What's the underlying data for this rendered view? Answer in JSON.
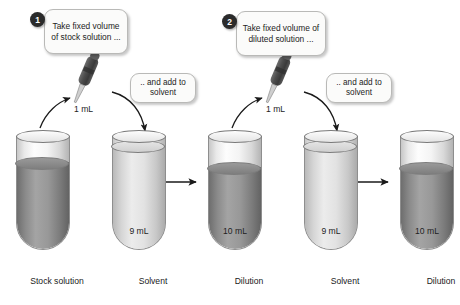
{
  "diagram": {
    "steps": [
      {
        "number": "1",
        "badge_name": "step-1-badge",
        "callout": "Take fixed volume of stock solution ...",
        "add_callout": ".. and add to solvent",
        "pipette_volume": "1 mL"
      },
      {
        "number": "2",
        "badge_name": "step-2-badge",
        "callout": "Take fixed volume of diluted solution ...",
        "add_callout": ".. and add to solvent",
        "pipette_volume": "1 mL"
      }
    ],
    "tubes": [
      {
        "caption": "Stock solution",
        "volume": "",
        "fill": "dark"
      },
      {
        "caption": "Solvent",
        "volume": "9 mL",
        "fill": "light"
      },
      {
        "caption": "Dilution",
        "volume": "10 mL",
        "fill": "dark"
      },
      {
        "caption": "Solvent",
        "volume": "9 mL",
        "fill": "light"
      },
      {
        "caption": "Dilution",
        "volume": "10 mL",
        "fill": "dark"
      }
    ],
    "colors": {
      "badge": "#2b2b2b",
      "callout_bg": "#fbfbfa",
      "callout_border": "#b9b9b7",
      "stock_fill": "#8a8a8a",
      "dilution_fill": "#9a9a9a",
      "solvent_fill": "#dcdcdc",
      "arrow": "#1a1a1a",
      "pipette": "#4a4a4a"
    }
  }
}
